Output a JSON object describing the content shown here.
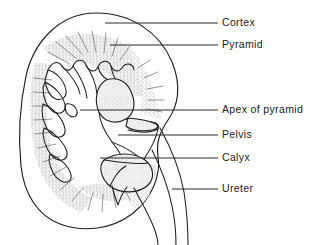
{
  "figure": {
    "view": "coronal section",
    "background_color": "#ffffff",
    "ink_color": "#1d1d1d",
    "shade_color": "#c9c9c9",
    "stipple_color": "#8a8a8a"
  },
  "labels": [
    {
      "id": "cortex",
      "text": "Cortex",
      "text_x": 222,
      "text_y": 26,
      "leader": {
        "x1": 105,
        "y1": 23,
        "x2": 218,
        "y2": 23
      },
      "target": "outer renal cortex"
    },
    {
      "id": "pyramid",
      "text": "Pyramid",
      "text_x": 222,
      "text_y": 48,
      "leader": {
        "x1": 110,
        "y1": 45,
        "x2": 218,
        "y2": 45
      },
      "target": "renal pyramid"
    },
    {
      "id": "apex-of-pyramid",
      "text": "Apex of pyramid",
      "text_x": 222,
      "text_y": 113,
      "leader": {
        "x1": 80,
        "y1": 110,
        "x2": 218,
        "y2": 110
      },
      "target": "renal papilla / apex of pyramid"
    },
    {
      "id": "pelvis",
      "text": "Pelvis",
      "text_x": 222,
      "text_y": 138,
      "leader": {
        "x1": 118,
        "y1": 135,
        "x2": 218,
        "y2": 135
      },
      "target": "renal pelvis"
    },
    {
      "id": "calyx",
      "text": "Calyx",
      "text_x": 222,
      "text_y": 161,
      "leader": {
        "x1": 100,
        "y1": 158,
        "x2": 218,
        "y2": 158
      },
      "target": "minor calyx"
    },
    {
      "id": "ureter",
      "text": "Ureter",
      "text_x": 222,
      "text_y": 192,
      "leader": {
        "x1": 172,
        "y1": 189,
        "x2": 218,
        "y2": 189
      },
      "target": "ureter"
    }
  ],
  "structures": [
    {
      "id": "kidney-outline",
      "name": "kidney outer contour (cortex border)"
    },
    {
      "id": "cortex-region",
      "name": "renal cortex (outer pale zone)"
    },
    {
      "id": "pyramid-stipple",
      "name": "renal pyramids (radially striated stipple)"
    },
    {
      "id": "minor-calyces",
      "name": "minor calyces (cup-shaped recesses)"
    },
    {
      "id": "major-calyx-upper",
      "name": "upper shaded calyx"
    },
    {
      "id": "major-calyx-lower",
      "name": "lower shaded calyx"
    },
    {
      "id": "renal-pelvis",
      "name": "renal pelvis (funnel narrowing to ureter)"
    },
    {
      "id": "ureter-tube",
      "name": "ureter (paired descending lines)"
    }
  ]
}
